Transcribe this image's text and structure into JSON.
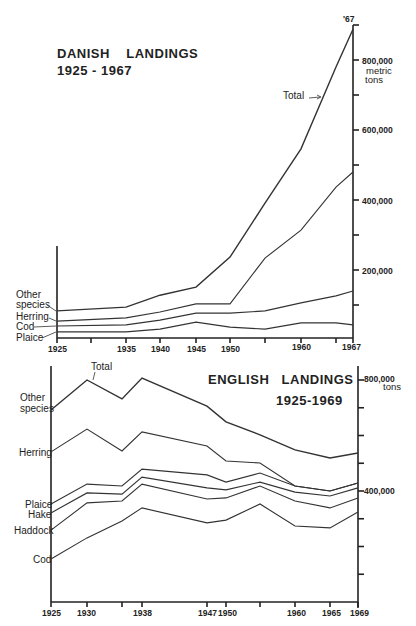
{
  "chart_data": [
    {
      "id": "danish",
      "type": "line",
      "stacked": true,
      "title": "DANISH LANDINGS",
      "subtitle": "1925 - 1967",
      "ylabel": "metric tons",
      "ylim": [
        0,
        900000
      ],
      "ytick_labels": [
        "200,000",
        "400,000",
        "600,000",
        "800,000"
      ],
      "ytick_values": [
        100000,
        200000,
        300000,
        400000,
        500000,
        600000,
        700000,
        800000,
        900000
      ],
      "xtick_labels": [
        "1925",
        "1935",
        "1940",
        "1945",
        "1950",
        "1960",
        "1967"
      ],
      "xtick_all": [
        1925,
        1930,
        1935,
        1940,
        1945,
        1950,
        1955,
        1960,
        1965,
        1967
      ],
      "top_marker": "'67",
      "x": [
        1925,
        1935,
        1940,
        1945,
        1950,
        1955,
        1960,
        1965,
        1967
      ],
      "series": [
        {
          "name": "Plaice",
          "cumulative_top": [
            23000,
            23000,
            31000,
            51000,
            37000,
            31000,
            49000,
            49000,
            43000
          ]
        },
        {
          "name": "Cod",
          "cumulative_top": [
            40000,
            43000,
            57000,
            77000,
            77000,
            83000,
            106000,
            126000,
            140000
          ]
        },
        {
          "name": "Herring",
          "cumulative_top": [
            54000,
            63000,
            80000,
            103000,
            103000,
            234000,
            314000,
            437000,
            480000
          ]
        },
        {
          "name": "Other species",
          "cumulative_top": [
            83000,
            94000,
            128000,
            151000,
            237000,
            391000,
            546000,
            780000,
            888000
          ]
        }
      ],
      "total_label": "Total",
      "grid": false,
      "legend": "inline labels at left"
    },
    {
      "id": "english",
      "type": "line",
      "stacked": true,
      "title": "ENGLISH LANDINGS",
      "subtitle": "1925-1969",
      "ylabel": "tons",
      "ylim": [
        0,
        850000
      ],
      "ytick_labels": [
        "400,000",
        "800,000"
      ],
      "ytick_values": [
        100000,
        200000,
        300000,
        400000,
        500000,
        600000,
        700000,
        800000
      ],
      "xtick_labels": [
        "1925",
        "1930",
        "1938",
        "1947",
        "1950",
        "1960",
        "1965",
        "1969"
      ],
      "xtick_all": [
        1925,
        1930,
        1934,
        1938,
        1947,
        1950,
        1955,
        1960,
        1965,
        1969
      ],
      "x": [
        1925,
        1930,
        1934,
        1938,
        1947,
        1950,
        1955,
        1960,
        1965,
        1969
      ],
      "series": [
        {
          "name": "Cod",
          "cumulative_top": [
            155000,
            231000,
            292000,
            339000,
            285000,
            295000,
            353000,
            274000,
            267000,
            324000
          ]
        },
        {
          "name": "Haddock",
          "cumulative_top": [
            259000,
            357000,
            364000,
            425000,
            371000,
            375000,
            418000,
            364000,
            339000,
            375000
          ]
        },
        {
          "name": "Hake",
          "cumulative_top": [
            321000,
            393000,
            389000,
            450000,
            411000,
            404000,
            432000,
            396000,
            382000,
            411000
          ]
        },
        {
          "name": "Plaice",
          "cumulative_top": [
            353000,
            425000,
            418000,
            479000,
            458000,
            432000,
            465000,
            418000,
            400000,
            429000
          ]
        },
        {
          "name": "Herring",
          "cumulative_top": [
            541000,
            623000,
            544000,
            613000,
            562000,
            508000,
            501000,
            418000,
            400000,
            429000
          ]
        },
        {
          "name": "Other species",
          "cumulative_top": [
            692000,
            800000,
            732000,
            807000,
            706000,
            649000,
            602000,
            548000,
            519000,
            537000
          ]
        }
      ],
      "total_label": "Total",
      "grid": false,
      "legend": "inline labels at left"
    }
  ],
  "labels": {
    "danish_title": "DANISH    LANDINGS",
    "danish_subtitle": "1925 - 1967",
    "danish_unit_1": "metric",
    "danish_unit_2": "tons",
    "danish_marker": "'67",
    "danish_total": "Total",
    "danish_series_other_1": "Other",
    "danish_series_other_2": "species",
    "danish_series_herring": "Herring",
    "danish_series_cod": "Cod",
    "danish_series_plaice": "Plaice",
    "danish_y": [
      "200,000",
      "400,000",
      "600,000",
      "800,000"
    ],
    "danish_x": [
      "1925",
      "1935",
      "1940",
      "1945",
      "1950",
      "1960",
      "1967"
    ],
    "english_title": "ENGLISH   LANDINGS",
    "english_subtitle": "1925-1969",
    "english_unit": "tons",
    "english_total": "Total",
    "english_series_other_1": "Other",
    "english_series_other_2": "species",
    "english_series_herring": "Herring",
    "english_series_plaice": "Plaice",
    "english_series_hake": "Hake",
    "english_series_haddock": "Haddock",
    "english_series_cod": "Cod",
    "english_y": [
      "800,000",
      "400,000"
    ],
    "english_x": [
      "1925",
      "1930",
      "1938",
      "1947",
      "1950",
      "1960",
      "1965",
      "1969"
    ]
  }
}
